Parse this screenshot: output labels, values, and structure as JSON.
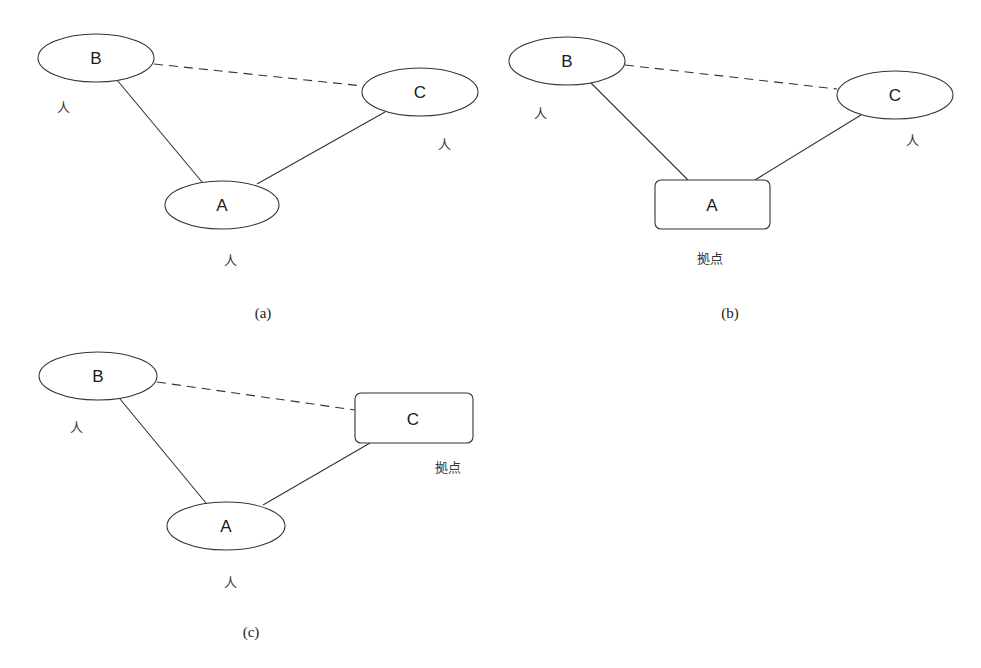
{
  "figure": {
    "panels": [
      {
        "id": "a",
        "caption": "(a)",
        "nodes": [
          {
            "id": "B",
            "label": "B",
            "shape": "ellipse",
            "role": "人"
          },
          {
            "id": "C",
            "label": "C",
            "shape": "ellipse",
            "role": "人"
          },
          {
            "id": "A",
            "label": "A",
            "shape": "ellipse",
            "role": "人"
          }
        ],
        "edges": [
          {
            "from": "B",
            "to": "C",
            "style": "dashed"
          },
          {
            "from": "B",
            "to": "A",
            "style": "solid"
          },
          {
            "from": "C",
            "to": "A",
            "style": "solid"
          }
        ]
      },
      {
        "id": "b",
        "caption": "(b)",
        "nodes": [
          {
            "id": "B",
            "label": "B",
            "shape": "ellipse",
            "role": "人"
          },
          {
            "id": "C",
            "label": "C",
            "shape": "ellipse",
            "role": "人"
          },
          {
            "id": "A",
            "label": "A",
            "shape": "rounded-rect",
            "role": "拠点"
          }
        ],
        "edges": [
          {
            "from": "B",
            "to": "C",
            "style": "dashed"
          },
          {
            "from": "B",
            "to": "A",
            "style": "solid"
          },
          {
            "from": "C",
            "to": "A",
            "style": "solid"
          }
        ]
      },
      {
        "id": "c",
        "caption": "(c)",
        "nodes": [
          {
            "id": "B",
            "label": "B",
            "shape": "ellipse",
            "role": "人"
          },
          {
            "id": "C",
            "label": "C",
            "shape": "rounded-rect",
            "role": "拠点"
          },
          {
            "id": "A",
            "label": "A",
            "shape": "ellipse",
            "role": "人"
          }
        ],
        "edges": [
          {
            "from": "B",
            "to": "C",
            "style": "dashed"
          },
          {
            "from": "B",
            "to": "A",
            "style": "solid"
          },
          {
            "from": "C",
            "to": "A",
            "style": "solid"
          }
        ]
      }
    ]
  }
}
